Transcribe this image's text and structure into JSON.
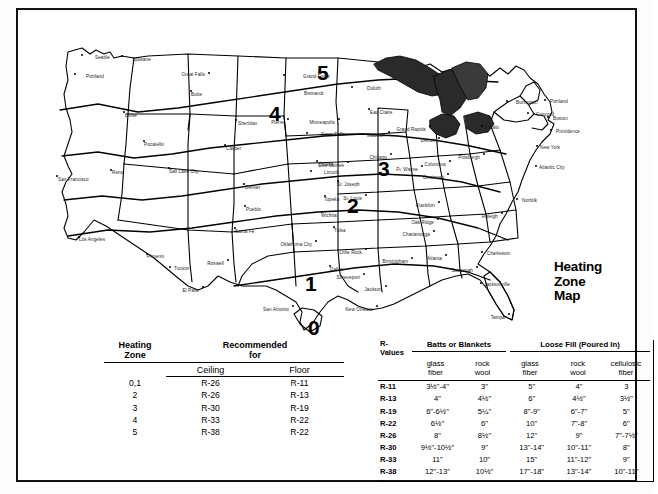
{
  "page": {
    "top_caption": ""
  },
  "map": {
    "title_lines": [
      "Heating",
      "Zone",
      "Map"
    ],
    "zones": [
      {
        "label": "5",
        "x": 279,
        "y": 38
      },
      {
        "label": "4",
        "x": 231,
        "y": 79
      },
      {
        "label": "3",
        "x": 340,
        "y": 134
      },
      {
        "label": "2",
        "x": 309,
        "y": 171
      },
      {
        "label": "1",
        "x": 267,
        "y": 249
      },
      {
        "label": "0",
        "x": 270,
        "y": 305
      }
    ],
    "cities": [
      {
        "name": "Seattle",
        "x": 43,
        "y": 30,
        "dx": 14,
        "dy": 5
      },
      {
        "name": "Spokane",
        "x": 83,
        "y": 31,
        "dx": 11,
        "dy": 6
      },
      {
        "name": "Portland",
        "x": 36,
        "y": 49,
        "dx": 12,
        "dy": 5
      },
      {
        "name": "Great Falls",
        "x": 170,
        "y": 48,
        "dx": -8,
        "dy": 4
      },
      {
        "name": "Grand Forks",
        "x": 245,
        "y": 50,
        "dx": 20,
        "dy": 4
      },
      {
        "name": "Bismarck",
        "x": 246,
        "y": 67,
        "dx": 20,
        "dy": 4
      },
      {
        "name": "Duluth",
        "x": 313,
        "y": 62,
        "dx": 16,
        "dy": 4
      },
      {
        "name": "Butte",
        "x": 152,
        "y": 66,
        "dx": 1,
        "dy": 6
      },
      {
        "name": "Boise",
        "x": 85,
        "y": 87,
        "dx": 2,
        "dy": 6
      },
      {
        "name": "Sheridan",
        "x": 197,
        "y": 95,
        "dx": 3,
        "dy": 6
      },
      {
        "name": "Pierre",
        "x": 249,
        "y": 94,
        "dx": -2,
        "dy": 6
      },
      {
        "name": "Sioux Falls",
        "x": 268,
        "y": 108,
        "dx": 15,
        "dy": 4
      },
      {
        "name": "Minneapolis",
        "x": 300,
        "y": 94,
        "dx": -8,
        "dy": 6
      },
      {
        "name": "Eau Claire",
        "x": 330,
        "y": 84,
        "dx": 2,
        "dy": 6
      },
      {
        "name": "Madison",
        "x": 350,
        "y": 107,
        "dx": -2,
        "dy": 6
      },
      {
        "name": "Grand Rapids",
        "x": 391,
        "y": 101,
        "dx": -6,
        "dy": 6
      },
      {
        "name": "Detroit",
        "x": 400,
        "y": 113,
        "dx": -3,
        "dy": 5
      },
      {
        "name": "Buffalo",
        "x": 443,
        "y": 101,
        "dx": 3,
        "dy": 4
      },
      {
        "name": "Burlington",
        "x": 468,
        "y": 76,
        "dx": 10,
        "dy": 4
      },
      {
        "name": "Concord",
        "x": 489,
        "y": 88,
        "dx": 9,
        "dy": 4
      },
      {
        "name": "Portland",
        "x": 506,
        "y": 75,
        "dx": 6,
        "dy": 4
      },
      {
        "name": "Boston",
        "x": 509,
        "y": 92,
        "dx": 6,
        "dy": 4
      },
      {
        "name": "Providence",
        "x": 512,
        "y": 105,
        "dx": 6,
        "dy": 4
      },
      {
        "name": "New York",
        "x": 498,
        "y": 121,
        "dx": 4,
        "dy": 4
      },
      {
        "name": "Atlantic City",
        "x": 497,
        "y": 141,
        "dx": 4,
        "dy": 4
      },
      {
        "name": "Pocatello",
        "x": 105,
        "y": 116,
        "dx": 1,
        "dy": 6
      },
      {
        "name": "Salt Lake City",
        "x": 130,
        "y": 143,
        "dx": 1,
        "dy": 6
      },
      {
        "name": "Casper",
        "x": 186,
        "y": 120,
        "dx": 2,
        "dy": 6
      },
      {
        "name": "Omaha",
        "x": 278,
        "y": 136,
        "dx": 2,
        "dy": 6
      },
      {
        "name": "Des Moines",
        "x": 309,
        "y": 137,
        "dx": -4,
        "dy": 6
      },
      {
        "name": "Chicago",
        "x": 352,
        "y": 129,
        "dx": -3,
        "dy": 6
      },
      {
        "name": "Ft. Wayne",
        "x": 383,
        "y": 141,
        "dx": -3,
        "dy": 6
      },
      {
        "name": "Columbus",
        "x": 411,
        "y": 136,
        "dx": -3,
        "dy": 6
      },
      {
        "name": "Pittsburgh",
        "x": 445,
        "y": 129,
        "dx": -3,
        "dy": 6
      },
      {
        "name": "Cincinnati",
        "x": 409,
        "y": 149,
        "dx": -3,
        "dy": 6
      },
      {
        "name": "Lincoln",
        "x": 272,
        "y": 146,
        "dx": 14,
        "dy": 4
      },
      {
        "name": "St. Joseph",
        "x": 299,
        "y": 156,
        "dx": 0,
        "dy": 6
      },
      {
        "name": "Denver",
        "x": 205,
        "y": 159,
        "dx": 2,
        "dy": 6
      },
      {
        "name": "Reno",
        "x": 72,
        "y": 145,
        "dx": 2,
        "dy": 5
      },
      {
        "name": "San Francisco",
        "x": 18,
        "y": 151,
        "dx": 2,
        "dy": 6
      },
      {
        "name": "Topeka",
        "x": 286,
        "y": 171,
        "dx": 0,
        "dy": 6
      },
      {
        "name": "St. Louis",
        "x": 327,
        "y": 170,
        "dx": -2,
        "dy": 6
      },
      {
        "name": "Frankfort",
        "x": 400,
        "y": 177,
        "dx": -2,
        "dy": 6
      },
      {
        "name": "Norfolk",
        "x": 478,
        "y": 174,
        "dx": 6,
        "dy": 4
      },
      {
        "name": "Raleigh",
        "x": 463,
        "y": 188,
        "dx": -4,
        "dy": 6
      },
      {
        "name": "Pueblo",
        "x": 206,
        "y": 181,
        "dx": 2,
        "dy": 6
      },
      {
        "name": "Wichita",
        "x": 283,
        "y": 187,
        "dx": 0,
        "dy": 6
      },
      {
        "name": "Oak Ridge",
        "x": 399,
        "y": 194,
        "dx": -3,
        "dy": 6
      },
      {
        "name": "Santa Fe",
        "x": 196,
        "y": 203,
        "dx": 1,
        "dy": 6
      },
      {
        "name": "Tulsa",
        "x": 295,
        "y": 202,
        "dx": 1,
        "dy": 6
      },
      {
        "name": "Chattanooga",
        "x": 395,
        "y": 206,
        "dx": -6,
        "dy": 6
      },
      {
        "name": "Oklahoma City",
        "x": 277,
        "y": 216,
        "dx": -4,
        "dy": 6
      },
      {
        "name": "Little Rock",
        "x": 327,
        "y": 224,
        "dx": -2,
        "dy": 6
      },
      {
        "name": "Los Angeles",
        "x": 40,
        "y": 212,
        "dx": 1,
        "dy": 5
      },
      {
        "name": "Phoenix",
        "x": 108,
        "y": 229,
        "dx": 1,
        "dy": 5
      },
      {
        "name": "Tucson",
        "x": 131,
        "y": 242,
        "dx": 5,
        "dy": 4
      },
      {
        "name": "Roswell",
        "x": 189,
        "y": 235,
        "dx": -2,
        "dy": 6
      },
      {
        "name": "Birmingham",
        "x": 373,
        "y": 233,
        "dx": -4,
        "dy": 6
      },
      {
        "name": "Atlanta",
        "x": 407,
        "y": 230,
        "dx": -2,
        "dy": 6
      },
      {
        "name": "Charleston",
        "x": 443,
        "y": 227,
        "dx": 6,
        "dy": 4
      },
      {
        "name": "Savannah",
        "x": 438,
        "y": 242,
        "dx": -3,
        "dy": 6
      },
      {
        "name": "Dallas",
        "x": 291,
        "y": 241,
        "dx": 1,
        "dy": 6
      },
      {
        "name": "Shreveport",
        "x": 325,
        "y": 249,
        "dx": -3,
        "dy": 6
      },
      {
        "name": "Jackson",
        "x": 347,
        "y": 261,
        "dx": -2,
        "dy": 6
      },
      {
        "name": "Jacksonville",
        "x": 442,
        "y": 258,
        "dx": 4,
        "dy": 4
      },
      {
        "name": "El Paso",
        "x": 164,
        "y": 262,
        "dx": -3,
        "dy": 6
      },
      {
        "name": "San Antonio",
        "x": 254,
        "y": 281,
        "dx": -4,
        "dy": 6
      },
      {
        "name": "New Orleans",
        "x": 338,
        "y": 281,
        "dx": -4,
        "dy": 6
      },
      {
        "name": "Tampa",
        "x": 470,
        "y": 289,
        "dx": -2,
        "dy": 6
      }
    ]
  },
  "left_table": {
    "header_zone": "Heating\nZone",
    "header_zone_line1": "Heating",
    "header_zone_line2": "Zone",
    "header_rec_line1": "Recommended",
    "header_rec_line2": "for",
    "sub_ceiling": "Ceiling",
    "sub_floor": "Floor",
    "rows": [
      {
        "zone": "0,1",
        "ceiling": "R-26",
        "floor": "R-11"
      },
      {
        "zone": "2",
        "ceiling": "R-26",
        "floor": "R-13"
      },
      {
        "zone": "3",
        "ceiling": "R-30",
        "floor": "R-19"
      },
      {
        "zone": "4",
        "ceiling": "R-33",
        "floor": "R-22"
      },
      {
        "zone": "5",
        "ceiling": "R-38",
        "floor": "R-22"
      }
    ]
  },
  "right_table": {
    "rvalues_head_line1": "R-",
    "rvalues_head_line2": "Values",
    "group_batts": "Batts or Blankets",
    "group_loose": "Loose Fill (Poured In)",
    "subheads": [
      {
        "line1": "glass",
        "line2": "fiber"
      },
      {
        "line1": "rock",
        "line2": "wool"
      },
      {
        "line1": "glass",
        "line2": "fiber"
      },
      {
        "line1": "rock",
        "line2": "wool"
      },
      {
        "line1": "cellulosic",
        "line2": "fiber"
      }
    ],
    "rows": [
      {
        "rvalue": "R-11",
        "batts_glass": "3½\"-4\"",
        "batts_rock": "3\"",
        "loose_glass": "5\"",
        "loose_rock": "4\"",
        "loose_cellulosic": "3"
      },
      {
        "rvalue": "R-13",
        "batts_glass": "4\"",
        "batts_rock": "4½\"",
        "loose_glass": "6\"",
        "loose_rock": "4½\"",
        "loose_cellulosic": "3½\""
      },
      {
        "rvalue": "R-19",
        "batts_glass": "6\"-6½\"",
        "batts_rock": "5¼\"",
        "loose_glass": "8\"-9\"",
        "loose_rock": "6\"-7\"",
        "loose_cellulosic": "5\""
      },
      {
        "rvalue": "R-22",
        "batts_glass": "6½\"",
        "batts_rock": "6\"",
        "loose_glass": "10\"",
        "loose_rock": "7\"-8\"",
        "loose_cellulosic": "6\""
      },
      {
        "rvalue": "R-26",
        "batts_glass": "8\"",
        "batts_rock": "8½\"",
        "loose_glass": "12\"",
        "loose_rock": "9\"",
        "loose_cellulosic": "7\"-7½\""
      },
      {
        "rvalue": "R-30",
        "batts_glass": "9½\"-10½\"",
        "batts_rock": "9\"",
        "loose_glass": "13\"-14\"",
        "loose_rock": "10\"-11\"",
        "loose_cellulosic": "8\""
      },
      {
        "rvalue": "R-33",
        "batts_glass": "11\"",
        "batts_rock": "10\"",
        "loose_glass": "15\"",
        "loose_rock": "11\"-12\"",
        "loose_cellulosic": "9\""
      },
      {
        "rvalue": "R-38",
        "batts_glass": "12\"-13\"",
        "batts_rock": "10½\"",
        "loose_glass": "17\"-18\"",
        "loose_rock": "13\"-14\"",
        "loose_cellulosic": "10\"-11\""
      }
    ]
  }
}
